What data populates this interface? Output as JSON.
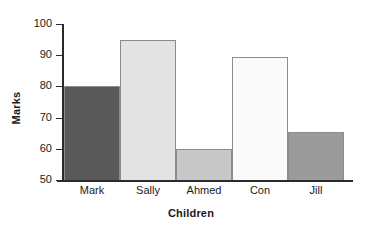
{
  "chart_data": {
    "type": "bar",
    "title": "",
    "xlabel": "Children",
    "ylabel": "Marks",
    "categories": [
      "Mark",
      "Sally",
      "Ahmed",
      "Con",
      "Jill"
    ],
    "values": [
      80,
      95,
      60,
      89.5,
      65.5
    ],
    "bar_colors": [
      "#595959",
      "#e3e3e3",
      "#c8c8c8",
      "#fafafa",
      "#9b9b9b"
    ],
    "bar_border_color": "#8c8c8c",
    "ylim": [
      50,
      100
    ],
    "ytick_labels": [
      "100",
      "90",
      "80",
      "70",
      "60",
      "50"
    ],
    "ytick_values": [
      100,
      90,
      80,
      70,
      60,
      50
    ],
    "grid": false,
    "legend": null,
    "axis_color": "#2b2b2b",
    "background": "#ffffff"
  },
  "axes": {
    "y_title": "Marks",
    "x_title": "Children"
  }
}
